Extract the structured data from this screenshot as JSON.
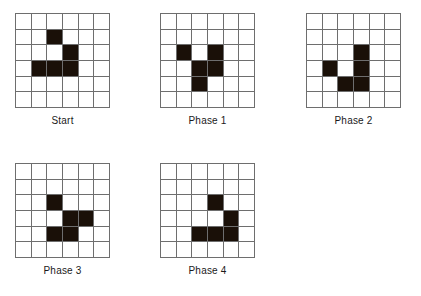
{
  "figure": {
    "title": "",
    "grid_rows": 6,
    "grid_cols": 6,
    "cell_size_px": 15.7,
    "colors": {
      "filled_cell": "#1a1008",
      "empty_cell": "#ffffff",
      "grid_line": "#6e6e6e",
      "caption_text": "#1a1a1a",
      "background": "#ffffff"
    }
  },
  "panels": [
    {
      "id": "start",
      "caption": "Start",
      "x": 15,
      "y": 13,
      "rows": 6,
      "cols": 6,
      "filled_cells": [
        [
          1,
          2
        ],
        [
          2,
          3
        ],
        [
          3,
          1
        ],
        [
          3,
          2
        ],
        [
          3,
          3
        ]
      ],
      "filled_count": 5
    },
    {
      "id": "phase-1",
      "caption": "Phase 1",
      "x": 160,
      "y": 13,
      "rows": 6,
      "cols": 6,
      "filled_cells": [
        [
          2,
          1
        ],
        [
          2,
          3
        ],
        [
          3,
          2
        ],
        [
          3,
          3
        ],
        [
          4,
          2
        ]
      ],
      "filled_count": 5
    },
    {
      "id": "phase-2",
      "caption": "Phase 2",
      "x": 306,
      "y": 13,
      "rows": 6,
      "cols": 6,
      "filled_cells": [
        [
          2,
          3
        ],
        [
          3,
          1
        ],
        [
          3,
          3
        ],
        [
          4,
          2
        ],
        [
          4,
          3
        ]
      ],
      "filled_count": 5
    },
    {
      "id": "phase-3",
      "caption": "Phase 3",
      "x": 15,
      "y": 163,
      "rows": 6,
      "cols": 6,
      "filled_cells": [
        [
          2,
          2
        ],
        [
          3,
          3
        ],
        [
          3,
          4
        ],
        [
          4,
          2
        ],
        [
          4,
          3
        ]
      ],
      "filled_count": 5
    },
    {
      "id": "phase-4",
      "caption": "Phase 4",
      "x": 160,
      "y": 163,
      "rows": 6,
      "cols": 6,
      "filled_cells": [
        [
          2,
          3
        ],
        [
          3,
          4
        ],
        [
          4,
          2
        ],
        [
          4,
          3
        ],
        [
          4,
          4
        ]
      ],
      "filled_count": 5
    }
  ]
}
